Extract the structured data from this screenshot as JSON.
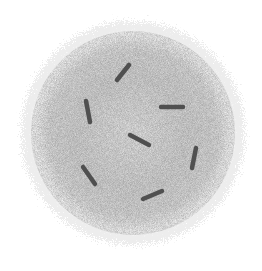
{
  "image": {
    "description": "Grayscale micrograph of a fuzzy spherical particle with short dark rod-shaped particles on its surface",
    "background": "#ffffff",
    "blob": {
      "center": [
        133,
        133
      ],
      "radius": 105,
      "core_color": "#d4d4d4",
      "edge_color": "#e9e9e9"
    },
    "rods": [
      {
        "x1": 117,
        "y1": 80,
        "x2": 129,
        "y2": 65
      },
      {
        "x1": 86,
        "y1": 101,
        "x2": 90,
        "y2": 122
      },
      {
        "x1": 161,
        "y1": 107,
        "x2": 183,
        "y2": 107
      },
      {
        "x1": 130,
        "y1": 135,
        "x2": 149,
        "y2": 145
      },
      {
        "x1": 196,
        "y1": 148,
        "x2": 192,
        "y2": 168
      },
      {
        "x1": 83,
        "y1": 167,
        "x2": 95,
        "y2": 184
      },
      {
        "x1": 143,
        "y1": 199,
        "x2": 162,
        "y2": 191
      }
    ],
    "rod_color": "#505050"
  }
}
